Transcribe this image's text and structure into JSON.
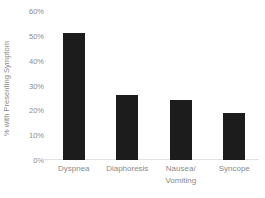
{
  "chart_data": {
    "type": "bar",
    "title": "",
    "xlabel": "",
    "ylabel": "% with Presenting Symptom",
    "categories": [
      "Dyspnea",
      "Diaphoresis",
      "Nausea/ Vomiting",
      "Syncope"
    ],
    "category_lines": [
      [
        "Dyspnea"
      ],
      [
        "Diaphoresis"
      ],
      [
        "Nausea/",
        "Vomiting"
      ],
      [
        "Syncope"
      ]
    ],
    "values": [
      51,
      26,
      24,
      19
    ],
    "value_labels": [
      "51%",
      "26%",
      "24%",
      "19%"
    ],
    "ylim": [
      0,
      60
    ],
    "ytick_values": [
      60,
      50,
      40,
      30,
      20,
      10,
      0
    ],
    "ytick_labels": [
      "60%",
      "50%",
      "40%",
      "30%",
      "20%",
      "10%",
      "0%"
    ],
    "grid": false,
    "legend": false,
    "bar_color": "#1c1c1c",
    "text_color": "#8a8a8a",
    "axis_line_color": "#e2e2e2",
    "background_color": "#ffffff"
  }
}
